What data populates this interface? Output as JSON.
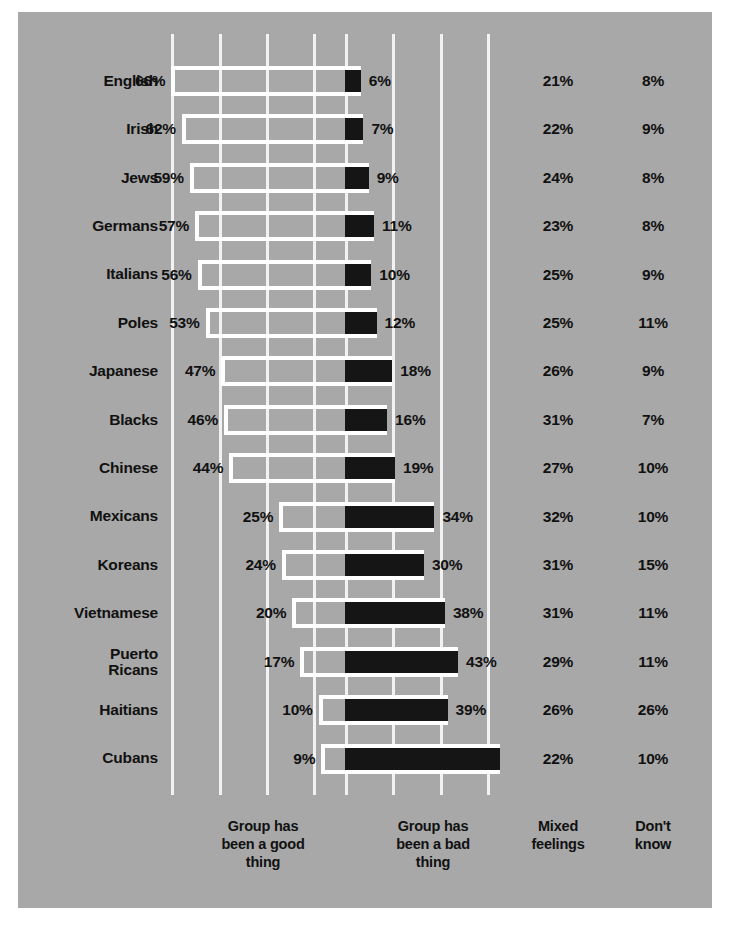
{
  "chart_data": {
    "type": "bar",
    "subtype": "diverging-bar",
    "title": "",
    "xlabel": "",
    "ylabel": "",
    "grid": true,
    "legend_position": "bottom",
    "axis": {
      "center_percent": 0,
      "left_max_percent": 70,
      "right_max_percent": 60,
      "gridline_percents_left": [
        66,
        48,
        30,
        12
      ],
      "gridline_step_percent": 18
    },
    "column_headers": [
      "Group has\nbeen a good\nthing",
      "Group has\nbeen a bad\nthing",
      "Mixed\nfeelings",
      "Don't\nknow"
    ],
    "categories": [
      "English",
      "Irish",
      "Jews",
      "Germans",
      "Italians",
      "Poles",
      "Japanese",
      "Blacks",
      "Chinese",
      "Mexicans",
      "Koreans",
      "Vietnamese",
      "Puerto\nRicans",
      "Haitians",
      "Cubans"
    ],
    "series": [
      {
        "name": "Group has been a good thing",
        "values": [
          66,
          62,
          59,
          57,
          56,
          53,
          47,
          46,
          44,
          25,
          24,
          20,
          17,
          10,
          9
        ]
      },
      {
        "name": "Group has been a bad thing",
        "values": [
          6,
          7,
          9,
          11,
          10,
          12,
          18,
          16,
          19,
          34,
          30,
          38,
          43,
          39,
          59
        ]
      },
      {
        "name": "Mixed feelings",
        "values": [
          21,
          22,
          24,
          23,
          25,
          25,
          26,
          31,
          27,
          32,
          31,
          31,
          29,
          26,
          22
        ]
      },
      {
        "name": "Don't know",
        "values": [
          8,
          9,
          8,
          8,
          9,
          11,
          9,
          7,
          10,
          10,
          15,
          11,
          11,
          26,
          10
        ]
      }
    ],
    "labels": {
      "good": [
        "66%",
        "62%",
        "59%",
        "57%",
        "56%",
        "53%",
        "47%",
        "46%",
        "44%",
        "25%",
        "24%",
        "20%",
        "17%",
        "10%",
        "9%"
      ],
      "bad": [
        "6%",
        "7%",
        "9%",
        "11%",
        "10%",
        "12%",
        "18%",
        "16%",
        "19%",
        "34%",
        "30%",
        "38%",
        "43%",
        "39%",
        ""
      ],
      "mixed": [
        "21%",
        "22%",
        "24%",
        "23%",
        "25%",
        "25%",
        "26%",
        "31%",
        "27%",
        "32%",
        "31%",
        "31%",
        "29%",
        "26%",
        "22%"
      ],
      "dont_know": [
        "8%",
        "9%",
        "8%",
        "8%",
        "9%",
        "11%",
        "9%",
        "7%",
        "10%",
        "10%",
        "15%",
        "11%",
        "11%",
        "26%",
        "10%"
      ]
    },
    "colors": {
      "background": "#a8a8a8",
      "good_bar_outline": "#ffffff",
      "bad_bar_fill": "#151515",
      "gridline": "#f2f2f2",
      "text": "#111111"
    }
  }
}
